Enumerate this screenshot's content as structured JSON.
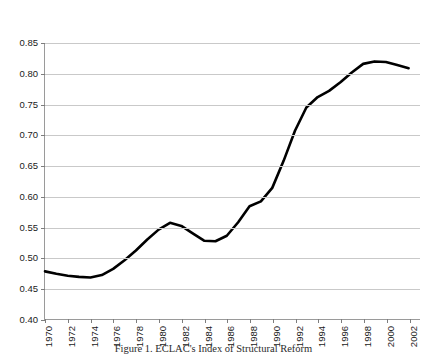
{
  "caption": "Figure 1. ECLAC's Index of Structural Reform",
  "colors": {
    "line": "#000000",
    "grid": "#c9c9c9",
    "axis": "#9a9a9a",
    "text": "#1a1a1a"
  },
  "chart_data": {
    "type": "line",
    "title": "",
    "xlabel": "",
    "ylabel": "",
    "xlim": [
      1970,
      2003
    ],
    "ylim": [
      0.4,
      0.85
    ],
    "ytick_values": [
      0.4,
      0.45,
      0.5,
      0.55,
      0.6,
      0.65,
      0.7,
      0.75,
      0.8,
      0.85
    ],
    "ytick_labels": [
      "0.40",
      "0.45",
      "0.50",
      "0.55",
      "0.60",
      "0.65",
      "0.70",
      "0.75",
      "0.80",
      "0.85"
    ],
    "xtick_values": [
      1970,
      1972,
      1974,
      1976,
      1978,
      1980,
      1982,
      1984,
      1986,
      1988,
      1990,
      1992,
      1994,
      1996,
      1998,
      2000,
      2002
    ],
    "xtick_labels": [
      "1970",
      "1972",
      "1974",
      "1976",
      "1978",
      "1980",
      "1982",
      "1984",
      "1986",
      "1988",
      "1990",
      "1992",
      "1994",
      "1996",
      "1998",
      "2000",
      "2002"
    ],
    "grid": "horizontal",
    "legend": "none",
    "series": [
      {
        "name": "ECLAC Index of Structural Reform",
        "color": "#000000",
        "x": [
          1970,
          1971,
          1972,
          1973,
          1974,
          1975,
          1976,
          1977,
          1978,
          1979,
          1980,
          1981,
          1982,
          1983,
          1984,
          1985,
          1986,
          1987,
          1988,
          1989,
          1990,
          1991,
          1992,
          1993,
          1994,
          1995,
          1996,
          1997,
          1998,
          1999,
          2000,
          2001,
          2002
        ],
        "values": [
          0.478,
          0.474,
          0.471,
          0.469,
          0.468,
          0.472,
          0.482,
          0.496,
          0.512,
          0.53,
          0.546,
          0.557,
          0.552,
          0.54,
          0.528,
          0.527,
          0.536,
          0.558,
          0.584,
          0.592,
          0.614,
          0.658,
          0.707,
          0.745,
          0.762,
          0.772,
          0.786,
          0.802,
          0.816,
          0.82,
          0.819,
          0.814,
          0.809
        ]
      }
    ]
  }
}
